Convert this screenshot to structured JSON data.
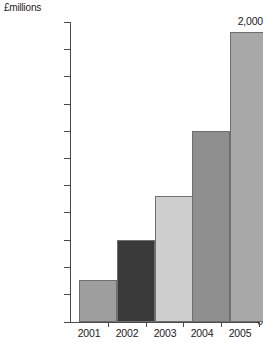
{
  "chart_data": {
    "type": "bar",
    "title": "",
    "unit_label": "£millions",
    "xlabel": "",
    "ylabel": "£millions",
    "categories": [
      "2001",
      "2002",
      "2003",
      "2004",
      "2005"
    ],
    "values": [
      1050,
      1200,
      1360,
      1600,
      1965
    ],
    "series": [
      {
        "name": "Revenue",
        "values": [
          1050,
          1200,
          1360,
          1600,
          1965
        ]
      }
    ],
    "bar_colors": [
      "#9e9e9e",
      "#3a3a3a",
      "#cfcfcf",
      "#8f8f8f",
      "#a8a8a8"
    ],
    "bar_border_color": "#6f6f6f",
    "ylim": [
      0,
      2000
    ],
    "y_axis_break": true,
    "y_axis_break_note": "axis is broken between 0 and 1,000",
    "y_display_min": 1000,
    "y_ticks": [
      {
        "value": 2000,
        "label": "2,000"
      },
      {
        "value": 1900,
        "label": "1,900"
      },
      {
        "value": 1800,
        "label": "1,800"
      },
      {
        "value": 1700,
        "label": "1,700"
      },
      {
        "value": 1600,
        "label": "1,600"
      },
      {
        "value": 1500,
        "label": "1,500"
      },
      {
        "value": 1400,
        "label": "1,400"
      },
      {
        "value": 1300,
        "label": "1,300"
      },
      {
        "value": 1200,
        "label": "1,200"
      },
      {
        "value": 1100,
        "label": "1,100"
      },
      {
        "value": 1000,
        "label": "1,000"
      },
      {
        "value": 0,
        "label": "0"
      }
    ],
    "grid": false,
    "legend": false,
    "legend_position": "none",
    "axis_color": "#4a4a4a",
    "background_color": "#ffffff"
  }
}
